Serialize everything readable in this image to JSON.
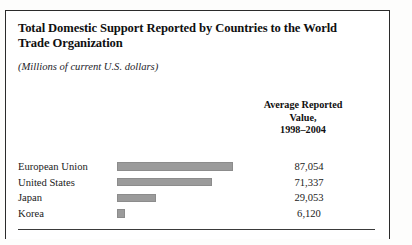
{
  "figure": {
    "title": "Total Domestic Support Reported by Countries to the World Trade Organization",
    "subtitle": "(Millions of current U.S. dollars)",
    "column_header": {
      "line1": "Average Reported",
      "line2": "Value,",
      "line3": "1998–2004"
    },
    "source_note": "TAKEN FROM: Congressional Budget Office, \"Policies that",
    "bar_color": "#9b9b9b",
    "frame_color": "#2b2b2b"
  },
  "chart_data": {
    "type": "bar",
    "title": "Total Domestic Support Reported by Countries to the World Trade Organization",
    "subtitle": "(Millions of current U.S. dollars)",
    "orientation": "horizontal",
    "xlabel": "",
    "ylabel": "",
    "value_column_header": "Average Reported Value, 1998–2004",
    "units": "Millions of current U.S. dollars",
    "period": "1998–2004",
    "grid": false,
    "legend": false,
    "xlim": [
      0,
      87054
    ],
    "categories": [
      "European Union",
      "United States",
      "Japan",
      "Korea"
    ],
    "values": [
      87054,
      71337,
      29053,
      6120
    ],
    "value_labels": [
      "87,054",
      "71,337",
      "29,053",
      "6,120"
    ],
    "bars": [
      {
        "label": "European Union",
        "value": 87054,
        "value_label": "87,054",
        "pct": 100.0
      },
      {
        "label": "United States",
        "value": 71337,
        "value_label": "71,337",
        "pct": 81.9
      },
      {
        "label": "Japan",
        "value": 29053,
        "value_label": "29,053",
        "pct": 33.4
      },
      {
        "label": "Korea",
        "value": 6120,
        "value_label": "6,120",
        "pct": 7.0
      }
    ]
  }
}
